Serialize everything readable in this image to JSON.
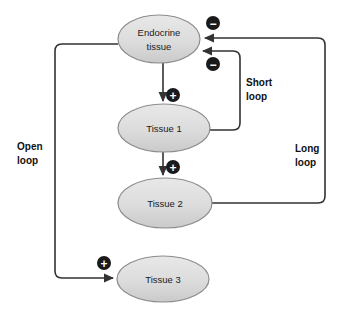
{
  "diagram": {
    "type": "endocrine-feedback-loop-diagram",
    "background_color": "#ffffff",
    "node_fill_top": "#e6e6e6",
    "node_fill_bottom": "#cccccc",
    "node_stroke": "#8c8c8c",
    "line_color": "#333333",
    "badge_fill": "#1a1a1a",
    "badge_text_color": "#ffffff",
    "nodes": [
      {
        "id": "endocrine-tissue",
        "line1": "Endocrine",
        "line2": "tissue",
        "cx": 159,
        "cy": 39,
        "rx": 41,
        "ry": 24
      },
      {
        "id": "tissue-1",
        "line1": "Tissue 1",
        "line2": "",
        "cx": 164,
        "cy": 128,
        "rx": 46,
        "ry": 24
      },
      {
        "id": "tissue-2",
        "line1": "Tissue 2",
        "line2": "",
        "cx": 165,
        "cy": 203,
        "rx": 47,
        "ry": 25
      },
      {
        "id": "tissue-3",
        "line1": "Tissue 3",
        "line2": "",
        "cx": 163,
        "cy": 279,
        "rx": 46,
        "ry": 23
      }
    ],
    "loop_labels": [
      {
        "id": "open-loop",
        "line1": "Open",
        "line2": "loop",
        "x": 17,
        "y": 150
      },
      {
        "id": "short-loop",
        "line1": "Short",
        "line2": "loop",
        "x": 246,
        "y": 86
      },
      {
        "id": "long-loop",
        "line1": "Long",
        "line2": "loop",
        "x": 295,
        "y": 152
      }
    ],
    "sign_badges": [
      {
        "id": "minus-long-loop",
        "sign": "−",
        "cx": 213,
        "cy": 23,
        "r": 7
      },
      {
        "id": "minus-short-loop",
        "sign": "−",
        "cx": 213,
        "cy": 64,
        "r": 7
      },
      {
        "id": "plus-endocrine-to-tissue1",
        "sign": "+",
        "cx": 173,
        "cy": 95,
        "r": 7
      },
      {
        "id": "plus-tissue1-to-tissue2",
        "sign": "+",
        "cx": 173,
        "cy": 167,
        "r": 7
      },
      {
        "id": "plus-open-loop-to-tissue3",
        "sign": "+",
        "cx": 104,
        "cy": 263,
        "r": 7
      }
    ],
    "connections": [
      {
        "id": "endocrine-to-tissue-1",
        "from": "endocrine-tissue",
        "to": "tissue-1",
        "effect": "+",
        "path": "M 163 63 L 163 103"
      },
      {
        "id": "tissue-1-to-tissue-2",
        "from": "tissue-1",
        "to": "tissue-2",
        "effect": "+",
        "path": "M 163 152 L 163 176"
      },
      {
        "id": "short-loop-feedback",
        "from": "tissue-1",
        "to": "endocrine-tissue",
        "effect": "−",
        "path": "M 210 130 L 233 130 Q 240 130 240 123 L 240 58 Q 240 51 233 51 L 201 51"
      },
      {
        "id": "long-loop-feedback",
        "from": "tissue-2",
        "to": "endocrine-tissue",
        "effect": "−",
        "path": "M 212 203 L 318 203 Q 325 203 325 196 L 325 45 Q 325 38 318 38 L 203 38"
      },
      {
        "id": "open-loop-to-tissue-3",
        "from": "endocrine-tissue",
        "to": "tissue-3",
        "effect": "+",
        "path": "M 118 44 L 62 44 Q 55 44 55 51 L 55 271 Q 55 278 62 278 L 115 278"
      }
    ]
  }
}
